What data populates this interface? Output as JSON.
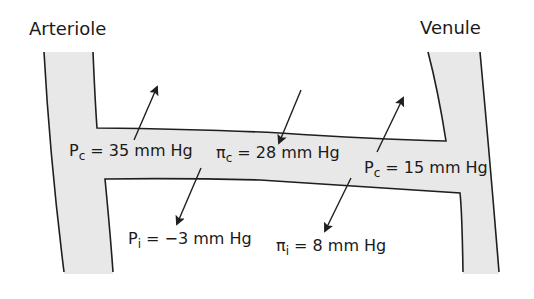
{
  "title_left": "Arteriole",
  "title_right": "Venule",
  "colors": {
    "vessel_fill": "#e8e8e8",
    "outline": "#1f1f1f",
    "background": "#ffffff",
    "text": "#1a1a1a"
  },
  "labels": {
    "pc_arterial": {
      "symbol": "P",
      "subscript": "c",
      "rest": " = 35 mm Hg"
    },
    "pic_capillary": {
      "symbol": "π",
      "subscript": "c",
      "rest": " = 28 mm Hg"
    },
    "pc_venous": {
      "symbol": "P",
      "subscript": "c",
      "rest": " = 15 mm Hg"
    },
    "pi_interstitial": {
      "symbol": "P",
      "subscript": "i",
      "rest": " = −3 mm Hg"
    },
    "pii_interstitial": {
      "symbol": "π",
      "subscript": "i",
      "rest": " = 8 mm Hg"
    }
  },
  "arrows": [
    {
      "name": "outward-arrow-arterial",
      "direction": "out"
    },
    {
      "name": "inward-arrow-oncotic",
      "direction": "in"
    },
    {
      "name": "outward-arrow-venous",
      "direction": "out"
    },
    {
      "name": "interstitial-pressure-arrow",
      "direction": "in"
    },
    {
      "name": "interstitial-oncotic-arrow",
      "direction": "in"
    }
  ]
}
